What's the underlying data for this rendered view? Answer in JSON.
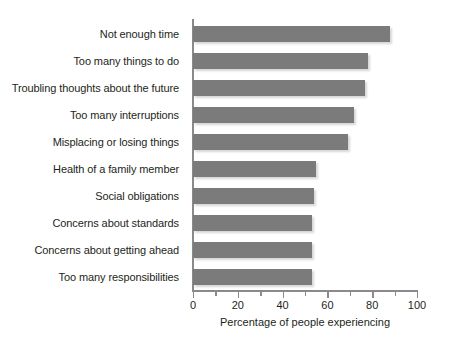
{
  "chart_data": {
    "type": "bar",
    "orientation": "horizontal",
    "title": "",
    "xlabel": "Percentage of people experiencing",
    "ylabel": "",
    "xlim": [
      0,
      100
    ],
    "xticks": [
      0,
      20,
      40,
      60,
      80,
      100
    ],
    "xtick_labels": [
      "0",
      "20",
      "40",
      "60",
      "80",
      "100"
    ],
    "minor_tick_interval": 10,
    "grid": false,
    "legend": null,
    "bar_color": "#7b7b7b",
    "axis_color": "#8a8a8a",
    "background_color": "#ffffff",
    "categories": [
      "Not enough time",
      "Too many things to do",
      "Troubling thoughts about the future",
      "Too many interruptions",
      "Misplacing or losing things",
      "Health of a family member",
      "Social obligations",
      "Concerns about standards",
      "Concerns about getting ahead",
      "Too many responsibilities"
    ],
    "values": [
      88,
      78,
      77,
      72,
      69,
      55,
      54,
      53,
      53,
      53
    ]
  }
}
